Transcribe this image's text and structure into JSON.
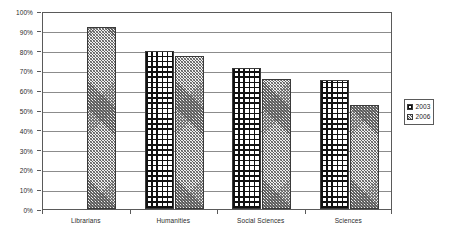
{
  "chart_data": {
    "type": "bar",
    "title": "",
    "subtitle": "",
    "xlabel": "",
    "ylabel": "",
    "categories": [
      "Librarians",
      "Humanities",
      "Social Sciences",
      "Sciences"
    ],
    "series": [
      {
        "name": "2003",
        "values": [
          null,
          80,
          71,
          65
        ],
        "pattern": "checkered",
        "color": "#111111"
      },
      {
        "name": "2006",
        "values": [
          92,
          77.5,
          65.5,
          52.5
        ],
        "pattern": "diagonal-hatch",
        "color": "#8f8f8f"
      }
    ],
    "ylim": [
      0,
      100
    ],
    "y_tick_labels": [
      "0%",
      "10%",
      "20%",
      "30%",
      "40%",
      "50%",
      "60%",
      "70%",
      "80%",
      "90%",
      "100%"
    ],
    "y_tick_values": [
      0,
      10,
      20,
      30,
      40,
      50,
      60,
      70,
      80,
      90,
      100
    ],
    "grid": true,
    "grid_axis": "y",
    "legend_position": "right-outside",
    "legend_entries": [
      "2003",
      "2006"
    ]
  },
  "legend": {
    "entries": [
      {
        "label": "2003"
      },
      {
        "label": "2006"
      }
    ]
  }
}
